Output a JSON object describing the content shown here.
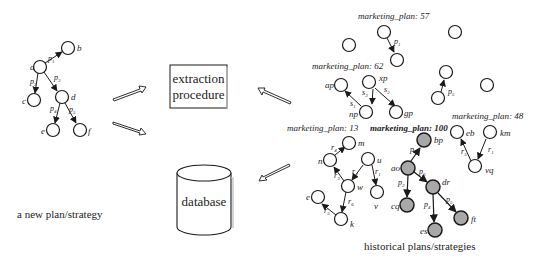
{
  "diagram": {
    "new_plan": {
      "caption": "a new plan/strategy",
      "nodes": [
        {
          "id": "a",
          "label": "a",
          "x": 40,
          "y": 67
        },
        {
          "id": "b",
          "label": "b",
          "x": 68,
          "y": 48
        },
        {
          "id": "c",
          "label": "c",
          "x": 34,
          "y": 100
        },
        {
          "id": "d",
          "label": "d",
          "x": 62,
          "y": 97
        },
        {
          "id": "e",
          "label": "e",
          "x": 53,
          "y": 130
        },
        {
          "id": "f",
          "label": "f",
          "x": 80,
          "y": 130
        }
      ],
      "edges": [
        {
          "from": "a",
          "to": "b",
          "label": "p1"
        },
        {
          "from": "a",
          "to": "c",
          "label": "p2"
        },
        {
          "from": "a",
          "to": "d",
          "label": "p3"
        },
        {
          "from": "d",
          "to": "e",
          "label": "p4"
        },
        {
          "from": "d",
          "to": "f",
          "label": "p5"
        }
      ]
    },
    "extraction": {
      "line1": "extraction",
      "line2": "procedure"
    },
    "database": {
      "label": "database"
    },
    "historical_caption": "historical plans/strategies",
    "historical_plans": [
      {
        "title": "marketing_plan: 57",
        "edges_text": [
          "p1"
        ]
      },
      {
        "title": "marketing_plan: 62",
        "nodes": [
          "xp",
          "ap",
          "np",
          "gp"
        ],
        "edges_text": [
          "s1",
          "s2",
          "s3"
        ]
      },
      {
        "title": "marketing_plan: 48",
        "nodes": [
          "eb",
          "km",
          "vq"
        ],
        "edges_text": [
          "r5",
          "r1"
        ]
      },
      {
        "title": "marketing_plan: 13",
        "nodes": [
          "m",
          "n",
          "u",
          "w",
          "v",
          "e",
          "k"
        ],
        "edges_text": [
          "r4",
          "r3",
          "r2",
          "r1",
          "r6",
          "r5"
        ]
      },
      {
        "title": "marketing_plan: 100",
        "highlighted": true,
        "nodes": [
          "bp",
          "ao",
          "cq",
          "dr",
          "es",
          "ft"
        ],
        "edges_text": [
          "p1",
          "p2",
          "p3",
          "p4",
          "p5"
        ]
      }
    ],
    "colors": {
      "node_fill": "#ffffff",
      "highlight_fill": "#a8a8a8",
      "stroke": "#1a1a1a"
    }
  }
}
